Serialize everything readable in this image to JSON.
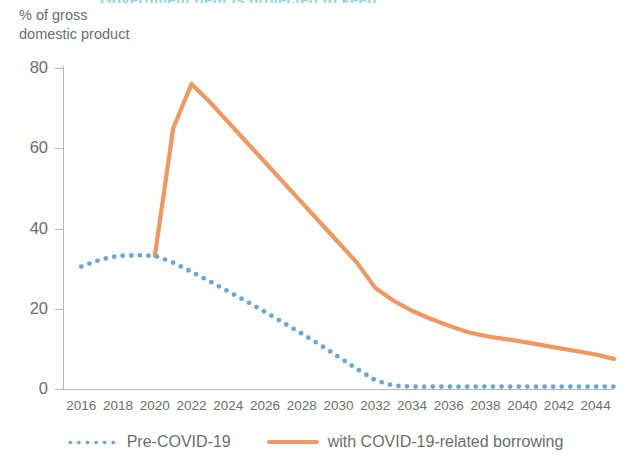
{
  "figure": {
    "title_sliver": "Government debt is projected to keep",
    "y_axis_caption_line1": "% of gross",
    "y_axis_caption_line2": "domestic product",
    "colors": {
      "pre_covid": "#6aa7d6",
      "with_covid": "#f2975d",
      "axis": "#b6b6b6",
      "text": "#6d6d6d",
      "title": "#8fd9e4"
    }
  },
  "legend": {
    "position": "bottom-center",
    "items": [
      {
        "label": "Pre-COVID-19",
        "style": "dotted",
        "color": "#6aa7d6"
      },
      {
        "label": "with COVID-19-related borrowing",
        "style": "solid",
        "color": "#f2975d"
      }
    ]
  },
  "chart_data": {
    "type": "line",
    "title": "Government debt is projected to keep",
    "xlabel": "",
    "ylabel": "% of gross domestic product",
    "xlim": [
      2015,
      2045
    ],
    "ylim": [
      0,
      80
    ],
    "yticks": [
      0,
      20,
      40,
      60,
      80
    ],
    "ytick_labels": [
      "0",
      "20",
      "40",
      "60",
      "80"
    ],
    "xticks": [
      2016,
      2018,
      2020,
      2022,
      2024,
      2026,
      2028,
      2030,
      2032,
      2034,
      2036,
      2038,
      2040,
      2042,
      2044
    ],
    "xtick_labels": [
      "2016",
      "2018",
      "2020",
      "2022",
      "2024",
      "2026",
      "2028",
      "2030",
      "2032",
      "2034",
      "2036",
      "2038",
      "2040",
      "2042",
      "2044"
    ],
    "grid": false,
    "x": [
      2016,
      2017,
      2018,
      2019,
      2020,
      2021,
      2022,
      2023,
      2024,
      2025,
      2026,
      2027,
      2028,
      2029,
      2030,
      2031,
      2032,
      2033,
      2034,
      2035,
      2036,
      2037,
      2038,
      2039,
      2040,
      2041,
      2042,
      2043,
      2044,
      2045
    ],
    "series": [
      {
        "name": "Pre-COVID-19",
        "style": "dotted",
        "color": "#6aa7d6",
        "values": [
          30.5,
          32.2,
          33.2,
          33.3,
          33.2,
          31.5,
          29.2,
          26.8,
          24.3,
          21.8,
          19.2,
          16.5,
          13.8,
          11.0,
          8.0,
          5.0,
          2.2,
          0.8,
          0.6,
          0.6,
          0.6,
          0.6,
          0.6,
          0.6,
          0.6,
          0.6,
          0.6,
          0.6,
          0.6,
          0.6
        ]
      },
      {
        "name": "with COVID-19-related borrowing",
        "style": "solid",
        "color": "#f2975d",
        "values": [
          null,
          null,
          null,
          null,
          33.2,
          65.0,
          76.0,
          71.5,
          66.5,
          61.5,
          56.5,
          51.5,
          46.5,
          41.5,
          36.5,
          31.5,
          25.2,
          22.0,
          19.5,
          17.5,
          15.8,
          14.2,
          13.2,
          12.5,
          11.8,
          11.0,
          10.2,
          9.4,
          8.6,
          7.5
        ]
      }
    ]
  }
}
